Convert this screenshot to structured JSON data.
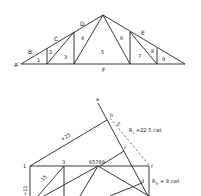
{
  "truss": {
    "title": "Roof truss (space diagram)",
    "outer_labels": [
      "A",
      "B",
      "C",
      "D",
      "E",
      "F"
    ],
    "panel_labels": [
      "1",
      "2",
      "3",
      "4",
      "5",
      "6",
      "7",
      "8",
      "9"
    ]
  },
  "force_diagram": {
    "title": "Force diagram",
    "point_labels": {
      "a": "a",
      "b": "b",
      "c": "c",
      "d": "d",
      "f": "f",
      "i": "1",
      "j": "3",
      "centre": "65789"
    },
    "member_values": {
      "top_left": "+25",
      "diag_left": "-15",
      "vertical_left": "+11"
    },
    "reactions": {
      "left": "R",
      "left_sub": "L",
      "left_value": "=22·5 cwt",
      "right": "R",
      "right_sub": "R",
      "right_value": "= 9 cwt"
    },
    "tick_label": "5"
  }
}
